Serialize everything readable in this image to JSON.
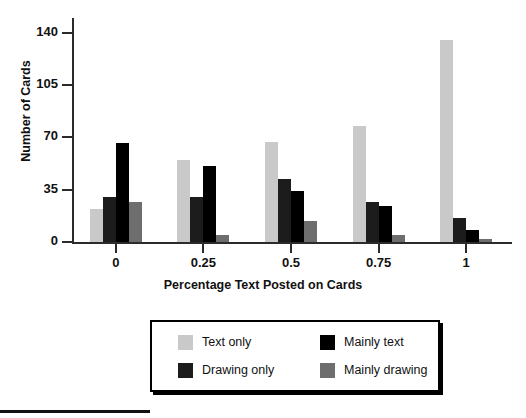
{
  "chart_data": {
    "type": "bar",
    "title": "",
    "xlabel": "Percentage Text Posted on Cards",
    "ylabel": "Number of Cards",
    "categories": [
      "0",
      "0.25",
      "0.5",
      "0.75",
      "1"
    ],
    "ytick_labels": [
      "0",
      "35",
      "70",
      "105",
      "140"
    ],
    "ytick_values": [
      0,
      35,
      70,
      105,
      140
    ],
    "ylim": [
      0,
      150
    ],
    "grid": false,
    "legend_position": "below-plot",
    "series": [
      {
        "name": "Text only",
        "color": "#c9c9c9",
        "values": [
          22,
          55,
          67,
          78,
          135
        ]
      },
      {
        "name": "Drawing only",
        "color": "#1c1c1c",
        "values": [
          30,
          30,
          42,
          27,
          16
        ]
      },
      {
        "name": "Mainly text",
        "color": "#000000",
        "values": [
          66,
          51,
          34,
          24,
          8
        ]
      },
      {
        "name": "Mainly drawing",
        "color": "#6e6e6e",
        "values": [
          27,
          5,
          14,
          5,
          2
        ]
      }
    ],
    "legend_order": [
      "Text only",
      "Mainly text",
      "Drawing only",
      "Mainly drawing"
    ]
  }
}
